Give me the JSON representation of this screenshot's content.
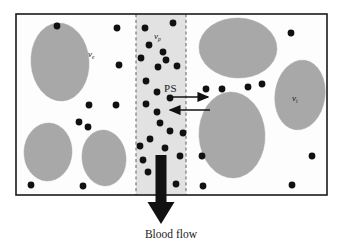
{
  "figure": {
    "caption": "Blood flow",
    "background_color": "#ffffff"
  },
  "colors": {
    "cell_fill": "#a8a8a8",
    "cell_stroke": "#a8a8a8",
    "plasma_strip_fill": "#e2e2e2",
    "plasma_strip_border": "#6e6e6e",
    "tissue_fill": "#fdfdfd",
    "frame_stroke": "#1a1a1a",
    "molecule_dot": "#111111",
    "arrow_color": "#111111",
    "text_color": "#1a1a1a"
  },
  "frame": {
    "name": "tissue-boundary",
    "x": 16,
    "y": 14,
    "width": 311,
    "height": 181,
    "stroke_width": 1.6
  },
  "plasma_strip": {
    "name": "plasma-compartment",
    "x": 136,
    "y": 14,
    "width": 50,
    "height": 181,
    "border_style": "dashed",
    "label": "v",
    "label_sub": "p",
    "label_full": "v_p"
  },
  "labels": {
    "extracellular": {
      "base": "v",
      "sub": "e",
      "full": "v_e"
    },
    "plasma": {
      "base": "v",
      "sub": "p",
      "full": "v_p"
    },
    "interstitial": {
      "base": "v",
      "sub": "i",
      "full": "v_i"
    },
    "permeability": "PS",
    "blood_flow": "Blood flow"
  },
  "exchange_arrows": [
    {
      "name": "ps-arrow-efflux",
      "direction": "right",
      "x1": 168,
      "y1": 97,
      "x2": 208,
      "y2": 97
    },
    {
      "name": "ps-arrow-influx",
      "direction": "left",
      "x1": 210,
      "y1": 110,
      "x2": 170,
      "y2": 110
    }
  ],
  "blood_flow_arrow": {
    "name": "blood-flow-arrow",
    "direction": "down",
    "x": 161,
    "y_start": 155,
    "y_end": 224,
    "shaft_width": 11,
    "head_width": 27,
    "head_height": 22
  },
  "cells": [
    {
      "name": "cell-left-1",
      "cx": 60,
      "cy": 62,
      "rx": 29,
      "ry": 39,
      "rot": -4,
      "region": "extravascular-left"
    },
    {
      "name": "cell-left-2",
      "cx": 48,
      "cy": 152,
      "rx": 24,
      "ry": 29,
      "rot": 3,
      "region": "extravascular-left"
    },
    {
      "name": "cell-left-3",
      "cx": 104,
      "cy": 158,
      "rx": 22,
      "ry": 28,
      "rot": -6,
      "region": "extravascular-left"
    },
    {
      "name": "cell-right-1",
      "cx": 238,
      "cy": 48,
      "rx": 39,
      "ry": 30,
      "rot": 2,
      "region": "interstitial-right"
    },
    {
      "name": "cell-right-2",
      "cx": 232,
      "cy": 135,
      "rx": 33,
      "ry": 43,
      "rot": -3,
      "region": "interstitial-right"
    },
    {
      "name": "cell-right-3",
      "cx": 300,
      "cy": 95,
      "rx": 25,
      "ry": 35,
      "rot": 8,
      "region": "interstitial-right"
    }
  ],
  "molecules": {
    "name": "tracer-molecules",
    "radius": 3.4,
    "left_region": [
      [
        57,
        26
      ],
      [
        117,
        28
      ],
      [
        119,
        65
      ],
      [
        89,
        105
      ],
      [
        116,
        105
      ],
      [
        79,
        122
      ],
      [
        88,
        127
      ],
      [
        31,
        185
      ],
      [
        83,
        186
      ]
    ],
    "plasma_region": [
      [
        145,
        28
      ],
      [
        173,
        23
      ],
      [
        149,
        45
      ],
      [
        163,
        52
      ],
      [
        141,
        58
      ],
      [
        166,
        60
      ],
      [
        177,
        66
      ],
      [
        146,
        81
      ],
      [
        157,
        92
      ],
      [
        146,
        104
      ],
      [
        157,
        112
      ],
      [
        160,
        123
      ],
      [
        170,
        131
      ],
      [
        150,
        139
      ],
      [
        183,
        133
      ],
      [
        140,
        146
      ],
      [
        165,
        148
      ],
      [
        143,
        160
      ],
      [
        180,
        156
      ],
      [
        148,
        172
      ],
      [
        162,
        181
      ],
      [
        176,
        184
      ],
      [
        158,
        67
      ],
      [
        170,
        98
      ]
    ],
    "right_region": [
      [
        291,
        33
      ],
      [
        206,
        89
      ],
      [
        222,
        89
      ],
      [
        248,
        87
      ],
      [
        262,
        84
      ],
      [
        203,
        186
      ],
      [
        292,
        185
      ],
      [
        312,
        156
      ],
      [
        202,
        156
      ]
    ]
  }
}
